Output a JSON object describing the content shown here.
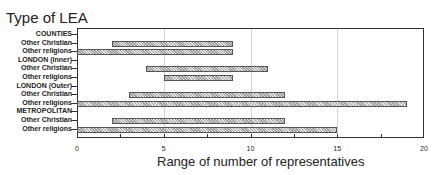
{
  "chart_data": {
    "type": "bar",
    "orientation": "horizontal-range",
    "title": "Type of LEA",
    "xlabel": "Range of number of representatives",
    "ylabel": "",
    "xlim": [
      0,
      20
    ],
    "xticks": [
      0,
      5,
      10,
      15,
      20
    ],
    "grid": true,
    "legend": null,
    "categories": [
      "COUNTIES",
      "Other Christian",
      "Other religions",
      "LONDON (Inner)",
      "Other Christian",
      "Other religions",
      "LONDON (Outer)",
      "Other Christian",
      "Other religions",
      "METROPOLITAN",
      "Other Christian",
      "Other religions"
    ],
    "groups": [
      {
        "name": "COUNTIES",
        "rows": [
          {
            "label": "Other Christian",
            "min": 2,
            "max": 9
          },
          {
            "label": "Other religions",
            "min": 0,
            "max": 9
          }
        ]
      },
      {
        "name": "LONDON (Inner)",
        "rows": [
          {
            "label": "Other Christian",
            "min": 4,
            "max": 11
          },
          {
            "label": "Other religions",
            "min": 5,
            "max": 9
          }
        ]
      },
      {
        "name": "LONDON (Outer)",
        "rows": [
          {
            "label": "Other Christian",
            "min": 3,
            "max": 12
          },
          {
            "label": "Other religions",
            "min": 0,
            "max": 19
          }
        ]
      },
      {
        "name": "METROPOLITAN",
        "rows": [
          {
            "label": "Other Christian",
            "min": 2,
            "max": 12
          },
          {
            "label": "Other religions",
            "min": 0,
            "max": 15
          }
        ]
      }
    ]
  }
}
